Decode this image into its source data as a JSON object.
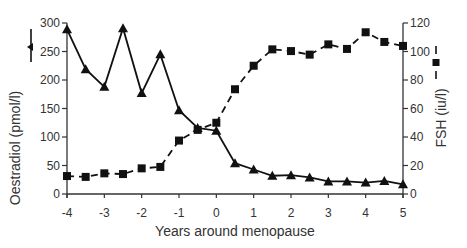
{
  "chart_data": {
    "type": "line",
    "title": "",
    "xlabel": "Years around menopause",
    "ylabel_left": "Oestradiol (pmol/l)",
    "ylabel_right": "FSH (iu/l)",
    "xlim": [
      -4,
      5
    ],
    "ylim_left": [
      0,
      300
    ],
    "ylim_right": [
      0,
      120
    ],
    "x_ticks": [
      -4,
      -3,
      -2,
      -1,
      0,
      1,
      2,
      3,
      4,
      5
    ],
    "y_ticks_left": [
      0,
      50,
      100,
      150,
      200,
      250,
      300
    ],
    "y_ticks_right": [
      0,
      20,
      40,
      60,
      80,
      100,
      120
    ],
    "grid": false,
    "legend_position": "inline with axis labels",
    "x": [
      -4,
      -3.5,
      -3,
      -2.5,
      -2,
      -1.5,
      -1,
      -0.5,
      0,
      0.5,
      1,
      1.5,
      2,
      2.5,
      3,
      3.5,
      4,
      4.5,
      5
    ],
    "series": [
      {
        "name": "Oestradiol (pmol/l)",
        "axis": "left",
        "marker": "triangle",
        "line": "solid",
        "values": [
          289,
          219,
          188,
          291,
          177,
          245,
          147,
          116,
          111,
          54,
          43,
          32,
          33,
          29,
          22,
          22,
          20,
          23,
          17
        ]
      },
      {
        "name": "FSH (iu/l)",
        "axis": "right",
        "marker": "square",
        "line": "dashed",
        "values": [
          12.6,
          12,
          14.5,
          14,
          18,
          19,
          37.5,
          45,
          50,
          73.5,
          90,
          101.5,
          100.3,
          97.8,
          105,
          101.8,
          113.5,
          106.7,
          103.9
        ]
      }
    ]
  },
  "labels": {
    "xlabel": "Years around menopause",
    "ylabel_left": "Oestradiol (pmol/l)",
    "ylabel_right": "FSH (iu/l)"
  },
  "colors": {
    "line": "#111111",
    "axis": "#333333",
    "text": "#333333"
  }
}
